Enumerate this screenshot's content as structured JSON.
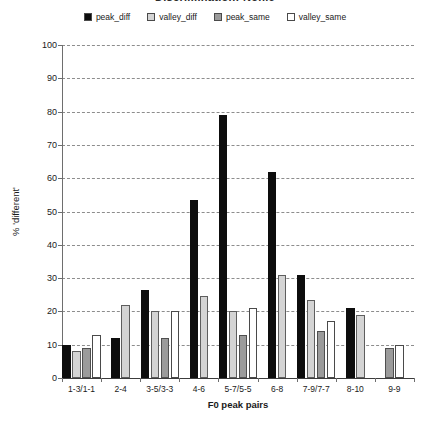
{
  "chart_data": {
    "type": "bar",
    "title": "Discrimination: Nonie",
    "xlabel": "F0 peak pairs",
    "ylabel": "% 'different'",
    "ylim": [
      0,
      100
    ],
    "ytick_step": 10,
    "yticks": [
      0,
      10,
      20,
      30,
      40,
      50,
      60,
      70,
      80,
      90,
      100
    ],
    "grid": true,
    "legend_position": "top-center",
    "categories": [
      "1-3/1-1",
      "2-4",
      "3-5/3-3",
      "4-6",
      "5-7/5-5",
      "6-8",
      "7-9/7-7",
      "8-10",
      "9-9"
    ],
    "series": [
      {
        "name": "peak_diff",
        "color": "#0d0d0d",
        "values": [
          10,
          12,
          26.5,
          53.5,
          79,
          62,
          31,
          21,
          null
        ]
      },
      {
        "name": "valley_diff",
        "color": "#d4d4d4",
        "values": [
          8,
          22,
          20,
          24.5,
          20,
          31,
          23.5,
          19,
          null
        ]
      },
      {
        "name": "peak_same",
        "color": "#9b9b9b",
        "values": [
          9,
          null,
          12,
          null,
          13,
          null,
          14,
          null,
          9
        ]
      },
      {
        "name": "valley_same",
        "color": "#ffffff",
        "values": [
          13,
          null,
          20,
          null,
          21,
          null,
          17,
          null,
          10
        ]
      }
    ]
  },
  "legend": {
    "entries": [
      {
        "label": "peak_diff",
        "color": "#0d0d0d"
      },
      {
        "label": "valley_diff",
        "color": "#d4d4d4"
      },
      {
        "label": "peak_same",
        "color": "#9b9b9b"
      },
      {
        "label": "valley_same",
        "color": "#ffffff"
      }
    ]
  }
}
